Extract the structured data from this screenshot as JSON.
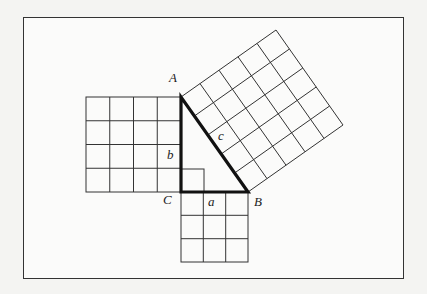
{
  "figure": {
    "labels": {
      "vertex_a": "A",
      "vertex_b": "B",
      "vertex_c": "C",
      "side_a": "a",
      "side_b": "b",
      "side_c": "c"
    },
    "squares": {
      "side_a_grid": "3x3",
      "side_b_grid": "4x4",
      "side_c_grid": "5x5"
    },
    "colors": {
      "line": "#222222",
      "background": "#fbfbfa",
      "page": "#f4f4f2"
    }
  }
}
